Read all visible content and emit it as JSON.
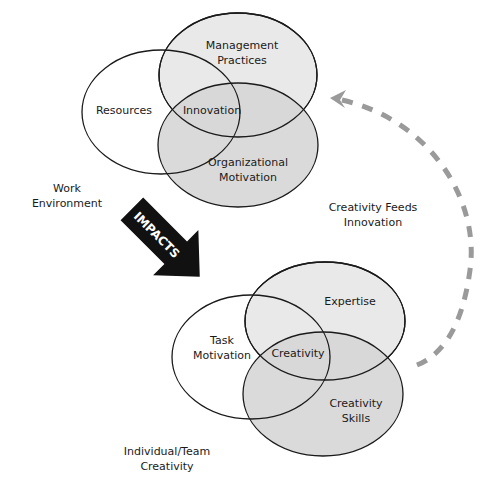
{
  "colors": {
    "background": "#ffffff",
    "outline": "#1a1a1a",
    "light_fill": "#e8e8e8",
    "dark_fill": "#d6d6d6",
    "arrow_fill": "#111111",
    "dash_color": "#9a9a9a"
  },
  "top_venn": {
    "group_label": "Work Environment",
    "group_label_lines": [
      "Work",
      "Environment"
    ],
    "circles": [
      {
        "label_lines": [
          "Resources"
        ]
      },
      {
        "label_lines": [
          "Management",
          "Practices"
        ]
      },
      {
        "label_lines": [
          "Organizational",
          "Motivation"
        ]
      }
    ],
    "center_label": "Innovation"
  },
  "bottom_venn": {
    "group_label_lines": [
      "Individual/Team",
      "Creativity"
    ],
    "circles": [
      {
        "label_lines": [
          "Task",
          "Motivation"
        ]
      },
      {
        "label_lines": [
          "Expertise"
        ]
      },
      {
        "label_lines": [
          "Creativity",
          "Skills"
        ]
      }
    ],
    "center_label": "Creativity"
  },
  "impacts_arrow": {
    "label": "IMPACTS"
  },
  "feedback_arrow": {
    "label_lines": [
      "Creativity Feeds",
      "Innovation"
    ]
  }
}
